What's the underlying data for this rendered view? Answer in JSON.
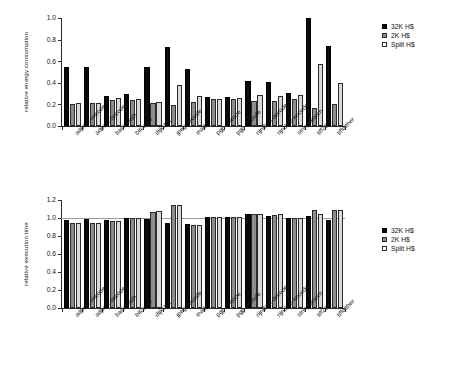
{
  "figure": {
    "background": "#ffffff",
    "series_colors": [
      "#0a0a0a",
      "#8d8d8d",
      "#d9d9d9"
    ]
  },
  "chart_data": [
    {
      "type": "bar",
      "title": "",
      "xlabel": "",
      "ylabel": "relative energy consumption",
      "ylim": [
        0.0,
        1.0
      ],
      "yticks": [
        "0.0",
        "0.2",
        "0.4",
        "0.6",
        "0.8",
        "1.0"
      ],
      "ytick_values": [
        0.0,
        0.2,
        0.4,
        0.6,
        0.8,
        1.0
      ],
      "grid": false,
      "legend_position": "right",
      "categories": [
        "adpcm encode",
        "adpcm decode",
        "basicmath",
        "bitcount",
        "dijkstra",
        "jpeg decode",
        "mad",
        "pgp encode",
        "pgp decode",
        "rijndael decode",
        "rijndael encode",
        "stringsearch",
        "tiff2bw",
        "tiffdither"
      ],
      "series": [
        {
          "name": "32K H$",
          "color": "#0a0a0a",
          "values": [
            0.55,
            0.55,
            0.28,
            0.3,
            0.55,
            0.73,
            0.53,
            0.27,
            0.27,
            0.42,
            0.41,
            0.31,
            1.0,
            0.74
          ]
        },
        {
          "name": "2K H$",
          "color": "#8d8d8d",
          "values": [
            0.2,
            0.21,
            0.24,
            0.24,
            0.21,
            0.19,
            0.22,
            0.25,
            0.25,
            0.23,
            0.23,
            0.25,
            0.17,
            0.2
          ]
        },
        {
          "name": "Split H$",
          "color": "#d9d9d9",
          "values": [
            0.21,
            0.21,
            0.26,
            0.25,
            0.22,
            0.38,
            0.28,
            0.25,
            0.26,
            0.29,
            0.28,
            0.29,
            0.57,
            0.4
          ]
        }
      ]
    },
    {
      "type": "bar",
      "title": "",
      "xlabel": "",
      "ylabel": "relative execution time",
      "ylim": [
        0.0,
        1.2
      ],
      "yticks": [
        "0.0",
        "0.2",
        "0.4",
        "0.6",
        "0.8",
        "1.0",
        "1.2"
      ],
      "ytick_values": [
        0.0,
        0.2,
        0.4,
        0.6,
        0.8,
        1.0,
        1.2
      ],
      "reference_line": 1.0,
      "grid": false,
      "legend_position": "right",
      "categories": [
        "adpcm encode",
        "adpcm decode",
        "basicmath",
        "bitcount",
        "dijkstra",
        "jpeg decode",
        "mad",
        "pgp encode",
        "pgp decode",
        "rijndael decode",
        "rijndael encode",
        "stringsearch",
        "tiff2bw",
        "tiffdither"
      ],
      "series": [
        {
          "name": "32K H$",
          "color": "#0a0a0a",
          "values": [
            0.98,
            0.99,
            0.98,
            1.0,
            0.99,
            0.94,
            0.93,
            1.01,
            1.01,
            1.04,
            1.02,
            1.0,
            1.02,
            0.98
          ]
        },
        {
          "name": "2K H$",
          "color": "#8d8d8d",
          "values": [
            0.94,
            0.94,
            0.97,
            1.0,
            1.07,
            1.15,
            0.92,
            1.01,
            1.01,
            1.05,
            1.03,
            1.0,
            1.09,
            1.09
          ]
        },
        {
          "name": "Split H$",
          "color": "#d9d9d9",
          "values": [
            0.94,
            0.94,
            0.97,
            1.0,
            1.08,
            1.14,
            0.92,
            1.01,
            1.01,
            1.04,
            1.04,
            1.0,
            1.04,
            1.09
          ]
        }
      ]
    }
  ],
  "legend": {
    "items": [
      {
        "label": "32K H$",
        "color": "#0a0a0a"
      },
      {
        "label": "2K H$",
        "color": "#8d8d8d"
      },
      {
        "label": "Split H$",
        "color": "#ffffff"
      }
    ]
  }
}
